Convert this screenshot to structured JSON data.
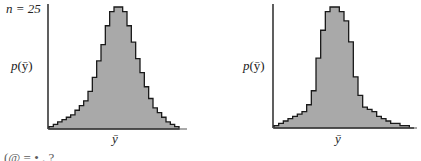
{
  "chart_data": [
    {
      "type": "bar",
      "style": "step-histogram",
      "annotation": "n = 25",
      "ylabel": "p(ȳ)",
      "xlabel": "ȳ",
      "fill_color": "#a9a9a9",
      "edge_color": "#1a1a1a",
      "grid": false,
      "bins": 30,
      "values": [
        1,
        2,
        3,
        4,
        5,
        6,
        8,
        10,
        12,
        16,
        22,
        29,
        36,
        44,
        50,
        52,
        52,
        50,
        44,
        37,
        30,
        24,
        18,
        13,
        9,
        7,
        5,
        3,
        2,
        1
      ]
    },
    {
      "type": "bar",
      "style": "step-histogram",
      "annotation": "",
      "ylabel": "p(ȳ)",
      "xlabel": "ȳ",
      "fill_color": "#a9a9a9",
      "edge_color": "#1a1a1a",
      "grid": false,
      "bins": 30,
      "values": [
        1,
        2,
        3,
        4,
        5,
        6,
        7,
        10,
        16,
        30,
        42,
        50,
        52,
        52,
        50,
        46,
        37,
        22,
        14,
        9,
        8,
        7,
        5,
        4,
        3,
        2,
        2,
        1,
        1,
        0
      ]
    }
  ],
  "labels": {
    "left_annotation": "n = 25",
    "left_ylabel_p": "p",
    "left_ylabel_arg": "(ȳ)",
    "left_xlabel": "ȳ",
    "right_ylabel_p": "p",
    "right_ylabel_arg": "(ȳ)",
    "right_xlabel": "ȳ",
    "bottom_fragment": "(@ = • . ?"
  }
}
